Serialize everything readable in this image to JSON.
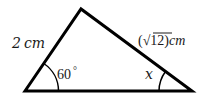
{
  "diagram": {
    "type": "triangle",
    "vertices": {
      "bottom_left": [
        25,
        91
      ],
      "top": [
        81,
        9
      ],
      "bottom_right": [
        192,
        91
      ]
    },
    "sides": {
      "left": {
        "label": "2 cm",
        "value": "2",
        "unit": "cm"
      },
      "right": {
        "label_prefix": "(",
        "radical": "√",
        "radicand": "12",
        "label_suffix": ")cm",
        "value": "√12",
        "unit": "cm"
      }
    },
    "angles": {
      "bottom_left": {
        "label": "60",
        "degree": "°"
      },
      "bottom_right": {
        "label": "x"
      }
    },
    "colors": {
      "stroke": "#000000",
      "text": "#1a1a1a"
    }
  }
}
